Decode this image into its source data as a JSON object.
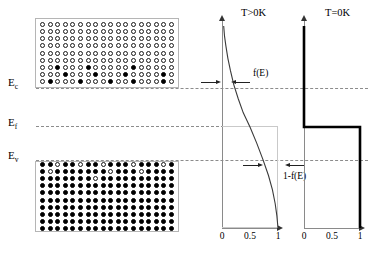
{
  "figure": {
    "accent_color": "#000000",
    "dash_color": "#8c8c8c",
    "axis_color": "#8a8a8a"
  },
  "energy_levels": [
    {
      "id": "Ec",
      "label": "E",
      "sub": "c",
      "name": "conduction-band-edge"
    },
    {
      "id": "Ef",
      "label": "E",
      "sub": "f",
      "name": "fermi-level"
    },
    {
      "id": "Ev",
      "label": "E",
      "sub": "v",
      "name": "valence-band-edge"
    }
  ],
  "bands": {
    "conduction": {
      "name": "conduction-band",
      "columns": 18,
      "rows": 9,
      "fill_state": "mostly-empty",
      "filled_cells": [
        [
          6,
          2
        ],
        [
          6,
          6
        ],
        [
          6,
          12
        ],
        [
          7,
          3
        ],
        [
          7,
          7
        ],
        [
          7,
          11
        ],
        [
          7,
          16
        ],
        [
          8,
          1
        ],
        [
          8,
          5
        ],
        [
          8,
          9
        ],
        [
          8,
          12
        ],
        [
          8,
          16
        ]
      ]
    },
    "valence": {
      "name": "valence-band",
      "columns": 18,
      "rows": 10,
      "fill_state": "mostly-filled",
      "empty_cells": [
        [
          0,
          2
        ],
        [
          0,
          5
        ],
        [
          0,
          8
        ],
        [
          0,
          12
        ],
        [
          0,
          16
        ],
        [
          1,
          1
        ],
        [
          1,
          9
        ],
        [
          1,
          13
        ],
        [
          2,
          7
        ]
      ]
    }
  },
  "charts": [
    {
      "id": "t-gt-0k",
      "title": "T>0K",
      "type": "line",
      "curve": "fermi-dirac",
      "xlabel": "",
      "ylabel": "E",
      "xlim": [
        0,
        1.15
      ],
      "ylim": [
        0,
        1
      ],
      "ticks": [
        "0",
        "0.5",
        "1"
      ],
      "tick_values": [
        0,
        0.5,
        1
      ],
      "annotations": [
        {
          "id": "f-of-e",
          "text": "f(E)",
          "at_level": "Ec",
          "description": "occupancy probability at conduction edge"
        },
        {
          "id": "one-minus-f-of-e",
          "text": "1-f(E)",
          "at_level": "Ev",
          "description": "hole probability at valence edge"
        }
      ],
      "chart_data": {
        "type": "line",
        "title": "T>0K",
        "xlabel": "f(E)",
        "ylabel": "E",
        "xlim": [
          0,
          1.15
        ],
        "ylim": [
          0,
          1
        ],
        "xticks": [
          0,
          0.5,
          1
        ],
        "xticklabels": [
          "0",
          "0.5",
          "1"
        ],
        "grid": false,
        "legend": null,
        "series": [
          {
            "name": "f(E) at T>0K",
            "x": [
              0.03,
              0.045,
              0.07,
              0.105,
              0.15,
              0.21,
              0.29,
              0.38,
              0.5,
              0.62,
              0.73,
              0.83,
              0.9,
              0.95,
              0.98,
              1.0
            ],
            "y": [
              1.0,
              0.95,
              0.9,
              0.84,
              0.78,
              0.71,
              0.64,
              0.57,
              0.5,
              0.42,
              0.34,
              0.26,
              0.19,
              0.12,
              0.06,
              0.0
            ]
          }
        ]
      }
    },
    {
      "id": "t-eq-0k",
      "title": "T=0K",
      "type": "line",
      "curve": "step",
      "xlabel": "",
      "ylabel": "E",
      "xlim": [
        0,
        1.15
      ],
      "ylim": [
        0,
        1
      ],
      "ticks": [
        "0",
        "0.5",
        "1"
      ],
      "tick_values": [
        0,
        0.5,
        1
      ],
      "chart_data": {
        "type": "line",
        "title": "T=0K",
        "xlabel": "f(E)",
        "ylabel": "E",
        "xlim": [
          0,
          1.15
        ],
        "ylim": [
          0,
          1
        ],
        "xticks": [
          0,
          0.5,
          1
        ],
        "xticklabels": [
          "0",
          "0.5",
          "1"
        ],
        "grid": false,
        "legend": null,
        "series": [
          {
            "name": "f(E) at T=0K (step)",
            "x": [
              0,
              0,
              1,
              1
            ],
            "y": [
              1.0,
              0.5,
              0.5,
              0.0
            ]
          }
        ]
      }
    }
  ]
}
